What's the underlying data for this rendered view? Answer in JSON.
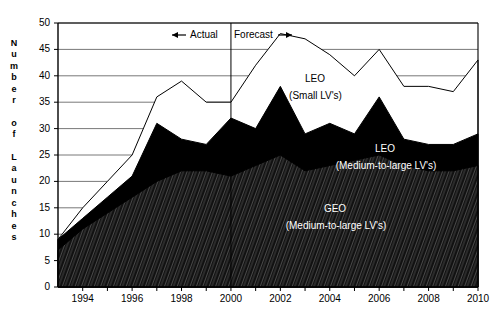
{
  "chart_data": {
    "type": "area",
    "title": "",
    "xlabel": "",
    "ylabel": "Number of Launches",
    "ylabel_chars": [
      "N",
      "u",
      "m",
      "b",
      "e",
      "r",
      "",
      "o",
      "f",
      "",
      "L",
      "a",
      "u",
      "n",
      "c",
      "h",
      "e",
      "s"
    ],
    "x": [
      1993,
      1994,
      1995,
      1996,
      1997,
      1998,
      1999,
      2000,
      2001,
      2002,
      2003,
      2004,
      2005,
      2006,
      2007,
      2008,
      2009,
      2010
    ],
    "xlim": [
      1993,
      2010
    ],
    "ylim": [
      0,
      50
    ],
    "yticks": [
      0,
      5,
      10,
      15,
      20,
      25,
      30,
      35,
      40,
      45,
      50
    ],
    "xticks": [
      1994,
      1996,
      1998,
      2000,
      2002,
      2004,
      2006,
      2008,
      2010
    ],
    "xtick_labels": [
      "1994",
      "1996",
      "1998",
      "2000",
      "2002",
      "2004",
      "2006",
      "2008",
      "2010"
    ],
    "grid": true,
    "legend_position": "inline-annotations",
    "series": [
      {
        "name": "GEO (Medium-to-large LV's)",
        "fill": "hatched-dark",
        "values": [
          7,
          11,
          14,
          17,
          20,
          22,
          22,
          21,
          23,
          25,
          22,
          23,
          24,
          25,
          23,
          22,
          22,
          23
        ]
      },
      {
        "name": "LEO (Medium-to-large LV's)",
        "fill": "solid-black",
        "values": [
          2,
          2,
          3,
          4,
          11,
          6,
          5,
          11,
          7,
          13,
          7,
          8,
          5,
          11,
          5,
          5,
          5,
          6
        ]
      },
      {
        "name": "LEO (Small LV's)",
        "fill": "white",
        "values": [
          0,
          2,
          3,
          4,
          5,
          11,
          8,
          3,
          12,
          10,
          18,
          13,
          11,
          9,
          10,
          11,
          10,
          14
        ]
      }
    ],
    "cumulative_totals": [
      9,
      15,
      20,
      25,
      36,
      39,
      35,
      35,
      42,
      48,
      47,
      44,
      40,
      45,
      38,
      38,
      37,
      43
    ],
    "cumulative_geo_plus_leo_ml": [
      9,
      13,
      17,
      21,
      31,
      28,
      27,
      32,
      30,
      38,
      29,
      31,
      29,
      36,
      28,
      27,
      27,
      29
    ],
    "annotations": [
      {
        "name": "actual-label",
        "text": "Actual",
        "arrow": "left"
      },
      {
        "name": "forecast-label",
        "text": "Forecast",
        "arrow": "right"
      },
      {
        "name": "divider-year",
        "value": 2000
      }
    ],
    "inline_labels": [
      {
        "name": "leo-small-label",
        "line1": "LEO",
        "line2": "(Small LV's)",
        "color": "#000000"
      },
      {
        "name": "leo-ml-label",
        "line1": "LEO",
        "line2": "(Medium-to-large LV's)",
        "color": "#ffffff"
      },
      {
        "name": "geo-ml-label",
        "line1": "GEO",
        "line2": "(Medium-to-large LV's)",
        "color": "#ffffff"
      }
    ]
  },
  "colors": {
    "background": "#ffffff",
    "axis": "#000000",
    "grid": "#555555",
    "leo_small": "#ffffff",
    "leo_ml": "#000000",
    "geo_ml": "#1a1a1a"
  }
}
